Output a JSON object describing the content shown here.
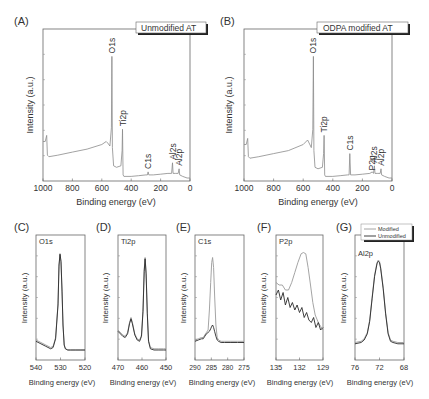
{
  "figure": {
    "panels": [
      {
        "id": "A",
        "label": "(A)",
        "title": "Unmodified AT",
        "xlabel": "Binding energy (eV)",
        "ylabel": "Intensity (a.u.)"
      },
      {
        "id": "B",
        "label": "(B)",
        "title": "ODPA modified AT",
        "xlabel": "Binding energy (eV)",
        "ylabel": "Intensity (a.u.)"
      },
      {
        "id": "C",
        "label": "(C)",
        "title": "O1s",
        "xlabel": "Binding energy (eV)",
        "ylabel": "Intensity (a.u.)"
      },
      {
        "id": "D",
        "label": "(D)",
        "title": "Ti2p",
        "xlabel": "Binding energy (eV)",
        "ylabel": "Intensity (a.u.)"
      },
      {
        "id": "E",
        "label": "(E)",
        "title": "C1s",
        "xlabel": "Binding energy (eV)",
        "ylabel": "Intensity (a.u.)"
      },
      {
        "id": "F",
        "label": "(F)",
        "title": "P2p",
        "xlabel": "Binding energy (eV)",
        "ylabel": "Intensity (a.u.)"
      },
      {
        "id": "G",
        "label": "(G)",
        "title": "Al2p",
        "xlabel": "Binding energy (eV)",
        "ylabel": "Intensity (a.u.)"
      }
    ],
    "legend": {
      "entries": [
        "Modified",
        "Unmodified"
      ]
    },
    "colors": {
      "modified": "#9a9a9a",
      "unmodified": "#2a2a2a",
      "axis": "#555555"
    }
  },
  "chart_data": [
    {
      "panel": "A",
      "type": "line",
      "title": "Unmodified AT",
      "xlabel": "Binding energy (eV)",
      "ylabel": "Intensity (a.u.)",
      "xlim": [
        1000,
        0
      ],
      "ylim": [
        0,
        100
      ],
      "x_reversed": true,
      "xticks": [
        1000,
        800,
        600,
        400,
        200,
        0
      ],
      "peaks": [
        {
          "name": "O1s",
          "x": 531,
          "y": 82
        },
        {
          "name": "Ti2p",
          "x": 459,
          "y": 34
        },
        {
          "name": "C1s",
          "x": 285,
          "y": 6
        },
        {
          "name": "Al2s",
          "x": 119,
          "y": 12
        },
        {
          "name": "Al2p",
          "x": 74,
          "y": 8
        }
      ],
      "series": [
        {
          "name": "Unmodified",
          "x": [
            1000,
            985,
            975,
            970,
            960,
            900,
            800,
            700,
            600,
            570,
            560,
            545,
            535,
            531,
            528,
            520,
            500,
            470,
            462,
            459,
            455,
            450,
            400,
            350,
            300,
            290,
            285,
            280,
            250,
            200,
            150,
            125,
            119,
            115,
            100,
            80,
            74,
            70,
            50,
            20,
            0
          ],
          "y": [
            26,
            26,
            30,
            17,
            16,
            17,
            19,
            21,
            24,
            26,
            25,
            23,
            35,
            82,
            22,
            10,
            9,
            10,
            20,
            34,
            4,
            3,
            3,
            3.5,
            4,
            4,
            6,
            4,
            4,
            4.5,
            5,
            5,
            12,
            5,
            5,
            5,
            8,
            4,
            3,
            2,
            2
          ]
        }
      ]
    },
    {
      "panel": "B",
      "type": "line",
      "title": "ODPA modified AT",
      "xlabel": "Binding energy (eV)",
      "ylabel": "Intensity (a.u.)",
      "xlim": [
        1000,
        0
      ],
      "ylim": [
        0,
        100
      ],
      "x_reversed": true,
      "xticks": [
        1000,
        800,
        600,
        400,
        200,
        0
      ],
      "peaks": [
        {
          "name": "O1s",
          "x": 531,
          "y": 82
        },
        {
          "name": "Ti2p",
          "x": 459,
          "y": 30
        },
        {
          "name": "C1s",
          "x": 285,
          "y": 18
        },
        {
          "name": "P2p",
          "x": 133,
          "y": 5
        },
        {
          "name": "Al2s",
          "x": 119,
          "y": 10
        },
        {
          "name": "Al2p",
          "x": 74,
          "y": 8
        }
      ],
      "series": [
        {
          "name": "Modified",
          "x": [
            1000,
            985,
            975,
            970,
            960,
            900,
            800,
            700,
            600,
            570,
            560,
            545,
            535,
            531,
            528,
            520,
            500,
            470,
            462,
            459,
            455,
            450,
            400,
            350,
            300,
            290,
            285,
            280,
            250,
            200,
            150,
            133,
            125,
            119,
            115,
            100,
            80,
            74,
            70,
            50,
            20,
            0
          ],
          "y": [
            24,
            24,
            28,
            16,
            15,
            16,
            18,
            20,
            24,
            27,
            25,
            22,
            34,
            82,
            20,
            9,
            8,
            9,
            18,
            30,
            4,
            3,
            3,
            3.5,
            4,
            4,
            18,
            4,
            4,
            4.5,
            5,
            6,
            5,
            10,
            5,
            5,
            5,
            8,
            4,
            3,
            2,
            2
          ]
        }
      ]
    },
    {
      "panel": "C",
      "type": "line",
      "title": "O1s",
      "xlabel": "Binding energy (eV)",
      "ylabel": "Intensity (a.u.)",
      "xlim": [
        540,
        520
      ],
      "ylim": [
        0,
        100
      ],
      "x_reversed": true,
      "xticks": [
        540,
        530,
        520
      ],
      "series": [
        {
          "name": "Modified",
          "x": [
            540,
            538,
            536,
            534,
            533,
            532,
            531,
            530.6,
            530.2,
            529.8,
            529.4,
            529,
            528.5,
            528,
            527,
            526,
            524,
            522,
            520
          ],
          "y": [
            16,
            14,
            12,
            10,
            11,
            18,
            45,
            75,
            84,
            78,
            55,
            28,
            12,
            9,
            8,
            8,
            8,
            8,
            8
          ]
        },
        {
          "name": "Unmodified",
          "x": [
            540,
            538,
            536,
            534,
            533,
            532,
            531,
            530.6,
            530.2,
            529.8,
            529.4,
            529,
            528.5,
            528,
            527,
            526,
            524,
            522,
            520
          ],
          "y": [
            15,
            13,
            11,
            9,
            10,
            17,
            44,
            76,
            85,
            79,
            56,
            28,
            12,
            9,
            8,
            8,
            8,
            8,
            8
          ]
        }
      ]
    },
    {
      "panel": "D",
      "type": "line",
      "title": "Ti2p",
      "xlabel": "Binding energy (eV)",
      "ylabel": "Intensity (a.u.)",
      "xlim": [
        470,
        450
      ],
      "ylim": [
        0,
        100
      ],
      "x_reversed": true,
      "xticks": [
        470,
        460,
        450
      ],
      "peaks": [
        {
          "name": "Ti2p1/2",
          "x": 464.5,
          "y": 34
        },
        {
          "name": "Ti2p3/2",
          "x": 458.7,
          "y": 82
        }
      ],
      "series": [
        {
          "name": "Modified",
          "x": [
            470,
            468,
            467,
            466,
            465.2,
            464.6,
            464,
            463,
            462,
            461,
            460.2,
            459.6,
            459.1,
            458.7,
            458.3,
            457.8,
            457.3,
            456.5,
            455,
            453,
            451,
            450
          ],
          "y": [
            24,
            20,
            19,
            22,
            30,
            34,
            30,
            21,
            17,
            16,
            20,
            40,
            72,
            82,
            70,
            38,
            16,
            10,
            9,
            9,
            9,
            9
          ]
        },
        {
          "name": "Unmodified",
          "x": [
            470,
            468,
            467,
            466,
            465.2,
            464.6,
            464,
            463,
            462,
            461,
            460.2,
            459.6,
            459.1,
            458.7,
            458.3,
            457.8,
            457.3,
            456.5,
            455,
            453,
            451,
            450
          ],
          "y": [
            23,
            19,
            18,
            21,
            29,
            33,
            29,
            20,
            16,
            15,
            19,
            39,
            71,
            81,
            69,
            37,
            15,
            9,
            8,
            8,
            8,
            8
          ]
        }
      ]
    },
    {
      "panel": "E",
      "type": "line",
      "title": "C1s",
      "xlabel": "Binding energy (eV)",
      "ylabel": "Intensity (a.u.)",
      "xlim": [
        290,
        275
      ],
      "ylim": [
        0,
        100
      ],
      "x_reversed": true,
      "xticks": [
        290,
        285,
        280,
        275
      ],
      "series": [
        {
          "name": "Modified",
          "x": [
            290,
            289,
            288,
            287.5,
            287,
            286.5,
            286,
            285.6,
            285.2,
            284.9,
            284.6,
            284.3,
            284,
            283.6,
            283.2,
            282.8,
            282,
            281,
            279,
            277,
            275
          ],
          "y": [
            16,
            17,
            18,
            18,
            20,
            22,
            24,
            40,
            62,
            78,
            82,
            74,
            52,
            28,
            18,
            16,
            15,
            15,
            15,
            15,
            15
          ]
        },
        {
          "name": "Unmodified",
          "x": [
            290,
            289,
            288,
            287.5,
            287,
            286.5,
            286,
            285.6,
            285.2,
            284.9,
            284.6,
            284.3,
            284,
            283.6,
            283.2,
            282.8,
            282,
            281,
            279,
            277,
            275
          ],
          "y": [
            15,
            16,
            17,
            17,
            19,
            21,
            22,
            23,
            25,
            27,
            28,
            26,
            23,
            19,
            16,
            15,
            14,
            14,
            14,
            14,
            14
          ]
        }
      ]
    },
    {
      "panel": "F",
      "type": "line",
      "title": "P2p",
      "xlabel": "Binding energy (eV)",
      "ylabel": "Intensity (a.u.)",
      "xlim": [
        135,
        129
      ],
      "ylim": [
        0,
        100
      ],
      "x_reversed": true,
      "xticks": [
        135,
        132,
        129
      ],
      "series": [
        {
          "name": "Modified",
          "x": [
            135,
            134.6,
            134.2,
            133.8,
            133.4,
            133,
            132.6,
            132.2,
            131.8,
            131.5,
            131.2,
            130.9,
            130.6,
            130.3,
            130,
            129.6,
            129.3,
            129
          ],
          "y": [
            62,
            60,
            60,
            56,
            56,
            62,
            70,
            78,
            85,
            86,
            85,
            74,
            60,
            46,
            36,
            30,
            27,
            24
          ]
        },
        {
          "name": "Unmodified",
          "x": [
            135,
            134.7,
            134.4,
            134.1,
            133.8,
            133.5,
            133.2,
            132.9,
            132.6,
            132.3,
            132,
            131.7,
            131.4,
            131.1,
            130.8,
            130.5,
            130.2,
            129.9,
            129.6,
            129.3,
            129
          ],
          "y": [
            52,
            56,
            48,
            54,
            44,
            50,
            42,
            46,
            40,
            44,
            38,
            42,
            34,
            38,
            32,
            30,
            34,
            26,
            30,
            24,
            26
          ]
        }
      ]
    },
    {
      "panel": "G",
      "type": "line",
      "title": "Al2p",
      "xlabel": "Binding energy (eV)",
      "ylabel": "Intensity (a.u.)",
      "xlim": [
        76,
        68
      ],
      "ylim": [
        0,
        100
      ],
      "x_reversed": true,
      "xticks": [
        76,
        72,
        68
      ],
      "legend": [
        "Modified",
        "Unmodified"
      ],
      "series": [
        {
          "name": "Modified",
          "x": [
            76,
            75,
            74.5,
            74,
            73.6,
            73.2,
            72.8,
            72.4,
            72.2,
            72,
            71.8,
            71.4,
            71,
            70.6,
            70.2,
            69.8,
            69,
            68
          ],
          "y": [
            14,
            15,
            17,
            22,
            32,
            50,
            68,
            78,
            80,
            79,
            74,
            58,
            38,
            22,
            16,
            15,
            14,
            14
          ]
        },
        {
          "name": "Unmodified",
          "x": [
            76,
            75,
            74.5,
            74,
            73.6,
            73.2,
            72.8,
            72.4,
            72.2,
            72,
            71.8,
            71.4,
            71,
            70.6,
            70.2,
            69.8,
            69,
            68
          ],
          "y": [
            13,
            14,
            16,
            21,
            31,
            49,
            67,
            77,
            79,
            78,
            73,
            57,
            37,
            21,
            15,
            14,
            13,
            13
          ]
        }
      ]
    }
  ]
}
